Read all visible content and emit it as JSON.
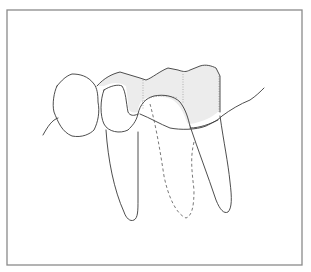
{
  "figure": {
    "colors": {
      "frame": "#8a8a8a",
      "outline": "#3a3a3a",
      "crown_shade": "#ececec",
      "background": "#ffffff"
    },
    "elements": [
      "frame",
      "left-premolar",
      "bridge-crown",
      "gum-line",
      "abutment-root-left",
      "missing-root-dashed",
      "abutment-root-right"
    ]
  }
}
